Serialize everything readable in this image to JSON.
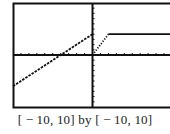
{
  "chart_data": {
    "type": "line",
    "title": "",
    "caption": "[ − 10, 10] by [ − 10, 10]",
    "xlabel": "",
    "ylabel": "",
    "xlim": [
      -10,
      10
    ],
    "ylim": [
      -10,
      10
    ],
    "xscale_tick": 1,
    "yscale_tick": 1,
    "grid": false,
    "series": [
      {
        "name": "piece-1",
        "style": "dashed",
        "x": [
          -10,
          0
        ],
        "y": [
          -6,
          4
        ],
        "rule": "y = x + 4, x < 0"
      },
      {
        "name": "piece-2",
        "style": "dotted",
        "x": [
          0,
          2
        ],
        "y": [
          0,
          4
        ],
        "rule": "y = 2x, 0 <= x <= 2"
      },
      {
        "name": "piece-3",
        "style": "solid",
        "x": [
          2,
          10
        ],
        "y": [
          4,
          4
        ],
        "rule": "y = 4, x > 2"
      }
    ],
    "colors": {
      "frame": "#111111",
      "axes": "#111111",
      "graph": "#111111"
    }
  }
}
